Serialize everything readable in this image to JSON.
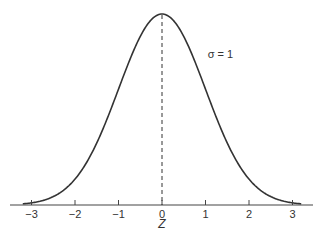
{
  "chart_data": {
    "type": "line",
    "title": "",
    "xlabel": "Z",
    "ylabel": "",
    "xlim": [
      -3.25,
      3.25
    ],
    "ylim": [
      0,
      0.4
    ],
    "grid": false,
    "legend": null,
    "x_ticks": [
      -3,
      -2,
      -1,
      0,
      1,
      2,
      3
    ],
    "x_tick_labels": [
      "−3",
      "−2",
      "−1",
      "0",
      "1",
      "2",
      "3"
    ],
    "series": [
      {
        "name": "Standard normal density",
        "function": "pdf(z) = exp(-z^2/2)/sqrt(2*pi)",
        "mean": 0,
        "sigma": 1,
        "x": [
          -3.2,
          -3,
          -2.5,
          -2,
          -1.5,
          -1,
          -0.5,
          0,
          0.5,
          1,
          1.5,
          2,
          2.5,
          3,
          3.2
        ],
        "values": [
          0.0024,
          0.0044,
          0.0175,
          0.054,
          0.1295,
          0.242,
          0.3521,
          0.3989,
          0.3521,
          0.242,
          0.1295,
          0.054,
          0.0175,
          0.0044,
          0.0024
        ]
      }
    ],
    "reference_lines": [
      {
        "type": "vertical",
        "x": 0,
        "style": "dashed"
      }
    ],
    "annotations": [
      {
        "text": "σ = 1",
        "x": 1.05,
        "y": 0.33
      }
    ]
  }
}
